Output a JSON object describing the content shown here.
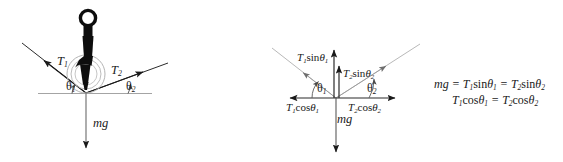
{
  "figure": {
    "background_color": "#ffffff",
    "width": 563,
    "height": 162
  },
  "colors": {
    "stroke_dark": "#1a1a1a",
    "stroke_gray": "#8c8c8c",
    "stroke_light_gray": "#a8a8a8",
    "object_fill": "#111111",
    "text": "#1a1a1a"
  },
  "left_panel": {
    "name": "rope-tension-setup",
    "labels": {
      "tension_left": {
        "base": "T",
        "sub": "1"
      },
      "tension_right": {
        "base": "T",
        "sub": "2"
      },
      "angle_left": {
        "base": "θ",
        "sub": "1"
      },
      "angle_right": {
        "base": "θ",
        "sub": "2"
      },
      "weight": "mg"
    },
    "geometry": {
      "knot_x": 86,
      "knot_y": 93,
      "rope_left_angle_deg": 38,
      "rope_right_angle_deg": 20
    }
  },
  "right_panel": {
    "name": "force-components",
    "labels": {
      "t1_sin": {
        "base": "T",
        "sub": "1",
        "fn": "sin",
        "angle": "θ",
        "angle_sub": "1"
      },
      "t2_sin": {
        "base": "T",
        "sub": "2",
        "fn": "sin",
        "angle": "θ",
        "angle_sub": "2"
      },
      "t1_cos": {
        "base": "T",
        "sub": "1",
        "fn": "cos",
        "angle": "θ",
        "angle_sub": "1"
      },
      "t2_cos": {
        "base": "T",
        "sub": "2",
        "fn": "cos",
        "angle": "θ",
        "angle_sub": "2"
      },
      "angle_left": {
        "base": "θ",
        "sub": "1"
      },
      "angle_right": {
        "base": "θ",
        "sub": "2"
      },
      "weight": "mg"
    },
    "geometry": {
      "origin_x": 336,
      "origin_y": 98
    }
  },
  "equations": [
    {
      "id": "vertical-equilibrium",
      "text": "mg = T1sinθ1 = T2sinθ2",
      "parts": [
        {
          "t": "mg",
          "style": "italic"
        },
        {
          "t": " = ",
          "style": "normal"
        },
        {
          "t": "T",
          "style": "italic"
        },
        {
          "t": "1",
          "style": "sub"
        },
        {
          "t": "sin",
          "style": "normal"
        },
        {
          "t": "θ",
          "style": "normal"
        },
        {
          "t": "1",
          "style": "sub"
        },
        {
          "t": " = ",
          "style": "normal"
        },
        {
          "t": "T",
          "style": "italic"
        },
        {
          "t": "2",
          "style": "sub"
        },
        {
          "t": "sin",
          "style": "normal"
        },
        {
          "t": "θ",
          "style": "normal"
        },
        {
          "t": "2",
          "style": "sub"
        }
      ]
    },
    {
      "id": "horizontal-equilibrium",
      "text": "T1cosθ1 = T2cosθ2",
      "parts": [
        {
          "t": "T",
          "style": "italic"
        },
        {
          "t": "1",
          "style": "sub"
        },
        {
          "t": "cos",
          "style": "normal"
        },
        {
          "t": "θ",
          "style": "normal"
        },
        {
          "t": "1",
          "style": "sub"
        },
        {
          "t": " = ",
          "style": "normal"
        },
        {
          "t": "T",
          "style": "italic"
        },
        {
          "t": "2",
          "style": "sub"
        },
        {
          "t": "cos",
          "style": "normal"
        },
        {
          "t": "θ",
          "style": "normal"
        },
        {
          "t": "2",
          "style": "sub"
        }
      ]
    }
  ],
  "icons": {
    "hanging_object": "hook-silhouette-icon",
    "ring": "concentric-ring-icon",
    "arrowhead": "arrowhead-icon"
  }
}
